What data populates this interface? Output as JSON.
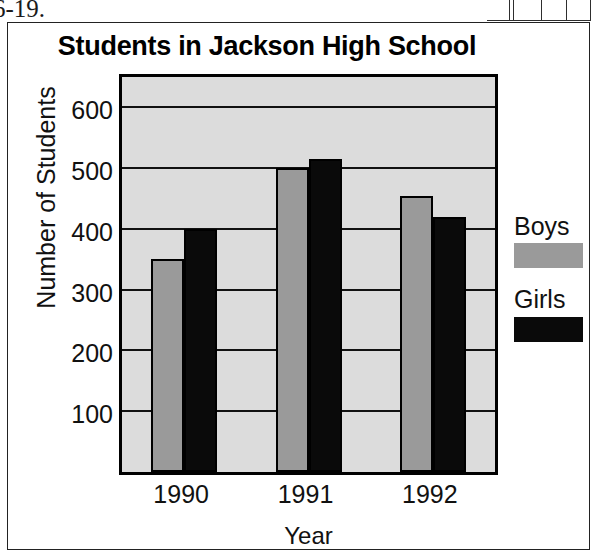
{
  "page": {
    "exercise_number": "6-19."
  },
  "chart_data": {
    "type": "bar",
    "title": "Students in Jackson High School",
    "xlabel": "Year",
    "ylabel": "Number of Students",
    "categories": [
      "1990",
      "1991",
      "1992"
    ],
    "series": [
      {
        "name": "Boys",
        "color": "#9a9a9a",
        "values": [
          350,
          500,
          455
        ]
      },
      {
        "name": "Girls",
        "color": "#0a0a0a",
        "values": [
          400,
          515,
          420
        ]
      }
    ],
    "ylim": [
      0,
      650
    ],
    "yticks": [
      100,
      200,
      300,
      400,
      500,
      600
    ],
    "ytick_labels": [
      "100",
      "200",
      "300",
      "400",
      "500",
      "600"
    ],
    "grid": true,
    "legend_position": "right",
    "plot_background": "#dcdcdc"
  }
}
